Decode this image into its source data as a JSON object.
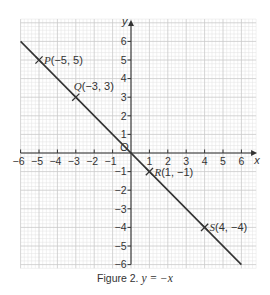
{
  "figure": {
    "caption_prefix": "Figure 2.",
    "caption_equation": "y = −x"
  },
  "chart_data": {
    "type": "line",
    "title": "Figure 2. y = −x",
    "equation": "y = -x",
    "xlabel": "x",
    "ylabel": "y",
    "origin_label": "O",
    "xlim": [
      -6,
      6.8
    ],
    "ylim": [
      -6.2,
      7.2
    ],
    "grid": true,
    "grid_minor_step": 0.2,
    "x_ticks": [
      -6,
      -5,
      -4,
      -3,
      -2,
      -1,
      1,
      2,
      3,
      4,
      5,
      6
    ],
    "x_tick_labels": [
      "−6",
      "−5",
      "−4",
      "−3",
      "−2",
      "−1",
      "1",
      "2",
      "3",
      "4",
      "5",
      "6"
    ],
    "y_ticks": [
      6,
      5,
      4,
      3,
      2,
      1,
      -1,
      -2,
      -3,
      -4,
      -5,
      -6
    ],
    "y_tick_labels": [
      "6",
      "5",
      "4",
      "3",
      "2",
      "1",
      "−1",
      "−2",
      "−3",
      "−4",
      "−5",
      "−6"
    ],
    "series": [
      {
        "name": "y = -x",
        "x": [
          -6,
          6
        ],
        "y": [
          6,
          -6
        ],
        "color": "#333333"
      }
    ],
    "points": [
      {
        "name": "P",
        "x": -5,
        "y": 5,
        "label": "(−5, 5)",
        "label_pos": "right"
      },
      {
        "name": "Q",
        "x": -3,
        "y": 3,
        "label": "(−3, 3)",
        "label_pos": "above-right"
      },
      {
        "name": "R",
        "x": 1,
        "y": -1,
        "label": "(1, −1)",
        "label_pos": "right"
      },
      {
        "name": "S",
        "x": 4,
        "y": -4,
        "label": "(4, −4)",
        "label_pos": "right"
      }
    ],
    "colors": {
      "grid_minor": "#e2e2e2",
      "grid_major": "#c9c9c9",
      "axis": "#333333",
      "line": "#333333"
    }
  }
}
